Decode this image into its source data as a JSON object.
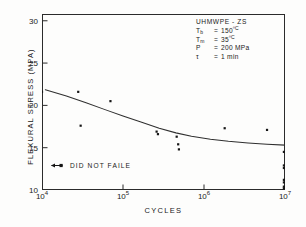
{
  "chart_data": {
    "type": "scatter",
    "title": "",
    "xlabel": "CYCLES",
    "ylabel": "FLEXURAL STRESS (MPA)",
    "xscale": "log",
    "xlim": [
      10000,
      10000000
    ],
    "ylim": [
      10,
      30.8
    ],
    "grid": false,
    "legend_position": "lower-left",
    "xticks": [
      {
        "value": 10000,
        "label": "10",
        "exponent": "4"
      },
      {
        "value": 100000,
        "label": "10",
        "exponent": "5"
      },
      {
        "value": 1000000,
        "label": "10",
        "exponent": "6"
      },
      {
        "value": 10000000,
        "label": "10",
        "exponent": "7"
      }
    ],
    "yticks": [
      {
        "value": 10,
        "label": "10"
      },
      {
        "value": 15,
        "label": "15"
      },
      {
        "value": 20,
        "label": "20"
      },
      {
        "value": 25,
        "label": "25"
      },
      {
        "value": 30,
        "label": "30"
      }
    ],
    "series": [
      {
        "name": "failed specimens",
        "marker": "square",
        "points": [
          {
            "x": 10000,
            "y": 21.6
          },
          {
            "x": 28000,
            "y": 21.6
          },
          {
            "x": 30000,
            "y": 17.6
          },
          {
            "x": 70000,
            "y": 20.5
          },
          {
            "x": 260000,
            "y": 16.9
          },
          {
            "x": 270000,
            "y": 16.6
          },
          {
            "x": 460000,
            "y": 16.3
          },
          {
            "x": 480000,
            "y": 15.4
          },
          {
            "x": 490000,
            "y": 14.8
          },
          {
            "x": 1800000,
            "y": 17.3
          },
          {
            "x": 6000000,
            "y": 17.1
          }
        ]
      },
      {
        "name": "did not fail (runout)",
        "marker": "square",
        "points": [
          {
            "x": 10000000,
            "y": 14.5
          },
          {
            "x": 10000000,
            "y": 12.9
          },
          {
            "x": 10000000,
            "y": 12.6
          },
          {
            "x": 10000000,
            "y": 11.2
          },
          {
            "x": 10000000,
            "y": 10.9
          },
          {
            "x": 10000000,
            "y": 10.4
          },
          {
            "x": 10000000,
            "y": 10.2
          }
        ]
      }
    ],
    "fit_curve": {
      "name": "fitted S-N curve",
      "points": [
        {
          "x": 11000,
          "y": 21.85
        },
        {
          "x": 20000,
          "y": 21.1
        },
        {
          "x": 35000,
          "y": 20.3
        },
        {
          "x": 60000,
          "y": 19.5
        },
        {
          "x": 100000,
          "y": 18.75
        },
        {
          "x": 170000,
          "y": 18.0
        },
        {
          "x": 280000,
          "y": 17.3
        },
        {
          "x": 450000,
          "y": 16.75
        },
        {
          "x": 700000,
          "y": 16.35
        },
        {
          "x": 1200000,
          "y": 16.0
        },
        {
          "x": 2000000,
          "y": 15.75
        },
        {
          "x": 3500000,
          "y": 15.55
        },
        {
          "x": 6000000,
          "y": 15.4
        },
        {
          "x": 10000000,
          "y": 15.3
        }
      ]
    },
    "annotations": {
      "conditions_title": "UHMWPE  -  ZS",
      "conditions": [
        {
          "symbol": "T",
          "subscript": "b",
          "equals": "=",
          "value": "150",
          "unit": "ºC"
        },
        {
          "symbol": "T",
          "subscript": "m",
          "equals": "=",
          "value": "35",
          "unit": "ºC"
        },
        {
          "symbol": "P",
          "subscript": "",
          "equals": "=",
          "value": "200",
          "unit": " MPa"
        },
        {
          "symbol": "τ",
          "subscript": "",
          "equals": "=",
          "value": "1",
          "unit": " min"
        }
      ],
      "runout_legend": "DID NOT FAILE"
    },
    "colors": {
      "axis": "#2b2b2b",
      "marker": "#151515",
      "curve": "#2f2f2f",
      "text": "#1a1a1a",
      "background": "#fdfdfc"
    }
  }
}
